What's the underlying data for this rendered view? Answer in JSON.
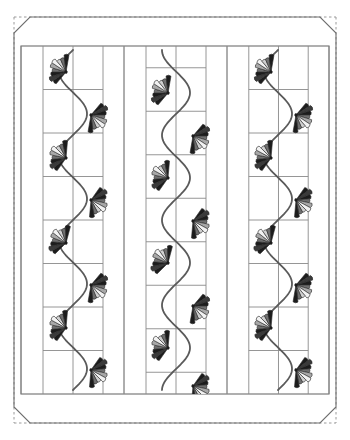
{
  "document": {
    "title": "Strip Quilt Layout Diagram",
    "type": "quilt-pattern-schematic",
    "canvas": {
      "width": 350,
      "height": 440,
      "background": "#ffffff"
    }
  },
  "palette": {
    "outline": "#444444",
    "grid_line": "#8a8a8a",
    "border_line": "#6e6e6e",
    "dashed_line": "#9a9a9a",
    "vine": "#5a5a5a",
    "background": "#ffffff",
    "petal_black": "#1c1c1c",
    "petal_dark": "#3a3a3a",
    "petal_mid": "#6f6f6f",
    "petal_light": "#a8a8a8",
    "petal_pale": "#d0d0d0",
    "petal_white": "#f2f2f2"
  },
  "frame": {
    "name": "quilt-outer-frame",
    "outer": {
      "x": 14,
      "y": 17,
      "width": 322,
      "height": 406
    },
    "inner": {
      "x": 21,
      "y": 46,
      "width": 308,
      "height": 348
    },
    "miter_size": 16,
    "corner_style": "mitered",
    "edge_style_outer": "dashed",
    "edge_style_miter": "solid",
    "border_top_label": "top border strip",
    "border_bottom_label": "bottom border strip"
  },
  "layout": {
    "panel_groups": 3,
    "panel_group_width": 103,
    "strips_per_group": 4,
    "strip_widths": [
      22,
      30,
      30,
      21
    ],
    "rows": 8,
    "row_height": 43.5,
    "note": "strips 2 and 3 of each group carry horizontal row divisions; outer strips are plain"
  },
  "chart_data": {
    "type": "table",
    "title": "Strip Quilt Layout Diagram",
    "columns": [
      "panel",
      "x_center",
      "vine_phase",
      "flower_count"
    ],
    "rows": [
      [
        "left panel",
        73,
        "start-left",
        8
      ],
      [
        "middle panel",
        176,
        "start-right",
        8
      ],
      [
        "right panel",
        278,
        "start-left",
        8
      ]
    ]
  },
  "panels": [
    {
      "name": "panel-left",
      "x": 21,
      "width": 103,
      "vine_center_x": 73,
      "amplitude": 14,
      "phase": 0,
      "flowers": [
        {
          "index": 1,
          "x": 66,
          "y": 72,
          "facing": "left",
          "rotation": 205
        },
        {
          "index": 2,
          "x": 91,
          "y": 115,
          "facing": "right",
          "rotation": 25
        },
        {
          "index": 3,
          "x": 66,
          "y": 158,
          "facing": "left",
          "rotation": 200
        },
        {
          "index": 4,
          "x": 91,
          "y": 200,
          "facing": "right",
          "rotation": 20
        },
        {
          "index": 5,
          "x": 66,
          "y": 243,
          "facing": "left",
          "rotation": 210
        },
        {
          "index": 6,
          "x": 91,
          "y": 285,
          "facing": "right",
          "rotation": 25
        },
        {
          "index": 7,
          "x": 66,
          "y": 328,
          "facing": "left",
          "rotation": 200
        },
        {
          "index": 8,
          "x": 91,
          "y": 370,
          "facing": "right",
          "rotation": 20
        }
      ]
    },
    {
      "name": "panel-middle",
      "x": 124,
      "width": 103,
      "vine_center_x": 176,
      "amplitude": 14,
      "phase": 21,
      "flowers": [
        {
          "index": 1,
          "x": 168,
          "y": 93,
          "facing": "left",
          "rotation": 205
        },
        {
          "index": 2,
          "x": 193,
          "y": 136,
          "facing": "right",
          "rotation": 25
        },
        {
          "index": 3,
          "x": 168,
          "y": 178,
          "facing": "left",
          "rotation": 200
        },
        {
          "index": 4,
          "x": 193,
          "y": 221,
          "facing": "right",
          "rotation": 20
        },
        {
          "index": 5,
          "x": 168,
          "y": 263,
          "facing": "left",
          "rotation": 210
        },
        {
          "index": 6,
          "x": 193,
          "y": 306,
          "facing": "right",
          "rotation": 25
        },
        {
          "index": 7,
          "x": 168,
          "y": 348,
          "facing": "left",
          "rotation": 200
        },
        {
          "index": 8,
          "x": 193,
          "y": 386,
          "facing": "right",
          "rotation": 20
        }
      ]
    },
    {
      "name": "panel-right",
      "x": 227,
      "width": 102,
      "vine_center_x": 278,
      "amplitude": 14,
      "phase": 0,
      "flowers": [
        {
          "index": 1,
          "x": 271,
          "y": 72,
          "facing": "left",
          "rotation": 205
        },
        {
          "index": 2,
          "x": 296,
          "y": 115,
          "facing": "right",
          "rotation": 25
        },
        {
          "index": 3,
          "x": 271,
          "y": 158,
          "facing": "left",
          "rotation": 200
        },
        {
          "index": 4,
          "x": 296,
          "y": 200,
          "facing": "right",
          "rotation": 20
        },
        {
          "index": 5,
          "x": 271,
          "y": 243,
          "facing": "left",
          "rotation": 210
        },
        {
          "index": 6,
          "x": 296,
          "y": 285,
          "facing": "right",
          "rotation": 25
        },
        {
          "index": 7,
          "x": 271,
          "y": 328,
          "facing": "left",
          "rotation": 200
        },
        {
          "index": 8,
          "x": 296,
          "y": 370,
          "facing": "right",
          "rotation": 20
        }
      ]
    }
  ],
  "flower_motif": {
    "name": "fan-flower-applique",
    "petal_count": 9,
    "radius": 17,
    "spread_degrees": 150,
    "petal_shades": [
      "#1c1c1c",
      "#3a3a3a",
      "#1c1c1c",
      "#6f6f6f",
      "#a8a8a8",
      "#f2f2f2",
      "#d0d0d0",
      "#6f6f6f",
      "#1c1c1c"
    ]
  }
}
